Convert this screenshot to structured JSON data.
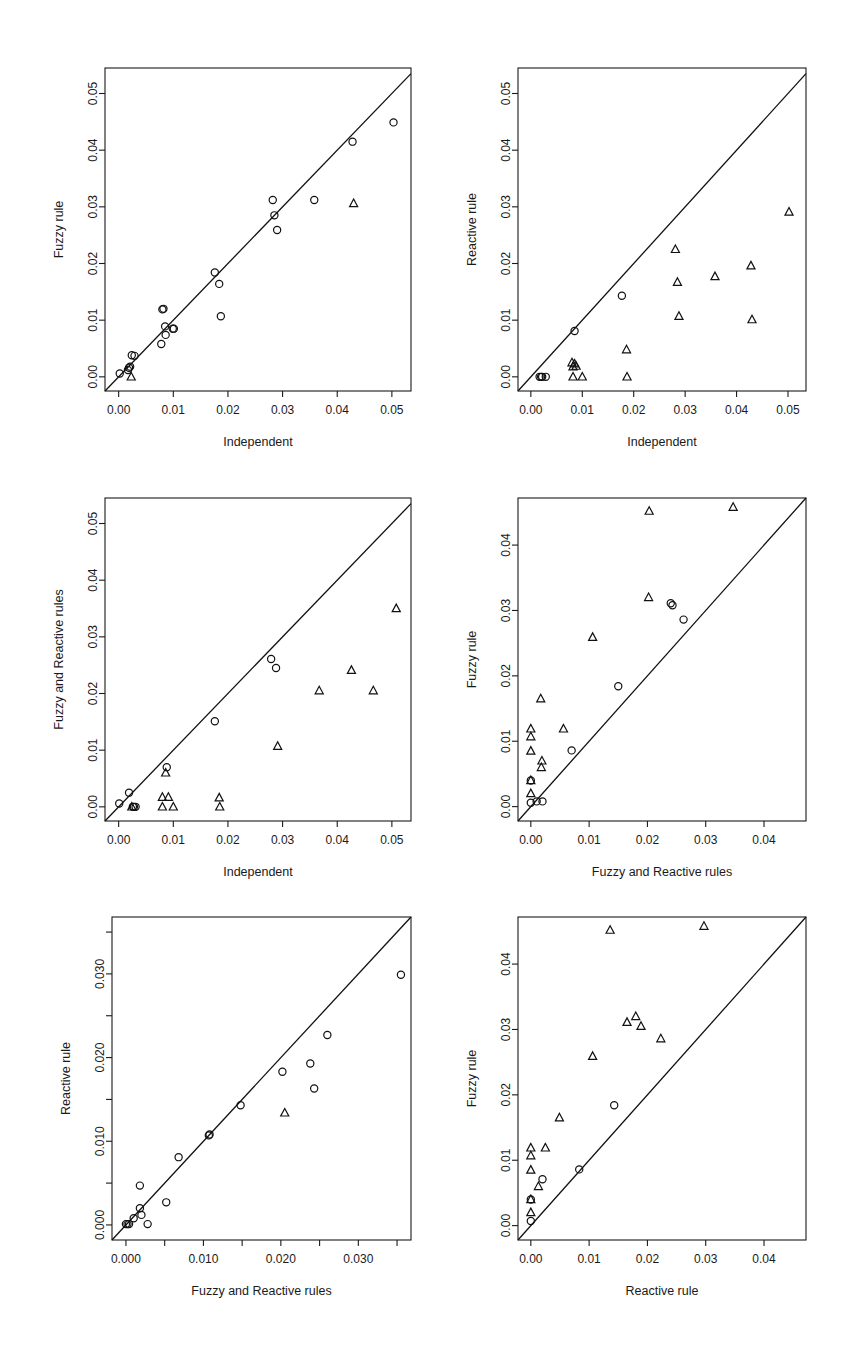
{
  "figure": {
    "background": "#ffffff",
    "marker_color": "#111111",
    "panel_count": 6,
    "layout": "3 rows x 2 columns of scatter plots",
    "reference_line": "y = x identity diagonal"
  },
  "chart_data": [
    {
      "id": "panel-1",
      "type": "scatter",
      "title": "",
      "xlabel": "Independent",
      "ylabel": "Fuzzy rule",
      "xlim": [
        -0.0025,
        0.0535
      ],
      "ylim": [
        -0.0025,
        0.0545
      ],
      "xticks": [
        0.0,
        0.01,
        0.02,
        0.03,
        0.04,
        0.05
      ],
      "xtick_labels": [
        "0.00",
        "0.01",
        "0.02",
        "0.03",
        "0.04",
        "0.05"
      ],
      "yticks": [
        0.0,
        0.01,
        0.02,
        0.03,
        0.04,
        0.05
      ],
      "ytick_labels": [
        "0.00",
        "0.01",
        "0.02",
        "0.03",
        "0.04",
        "0.05"
      ],
      "grid": false,
      "legend": "none",
      "annotations": [
        "identity line y = x"
      ],
      "series": [
        {
          "name": "circle",
          "marker": "circle",
          "points": [
            [
              0.0002,
              0.0006
            ],
            [
              0.0017,
              0.0012
            ],
            [
              0.0019,
              0.0016
            ],
            [
              0.0021,
              0.0018
            ],
            [
              0.0024,
              0.0038
            ],
            [
              0.0029,
              0.0037
            ],
            [
              0.0078,
              0.0058
            ],
            [
              0.008,
              0.0119
            ],
            [
              0.0082,
              0.012
            ],
            [
              0.0085,
              0.0089
            ],
            [
              0.0086,
              0.0074
            ],
            [
              0.0099,
              0.0085
            ],
            [
              0.0101,
              0.0085
            ],
            [
              0.0176,
              0.0184
            ],
            [
              0.0184,
              0.0164
            ],
            [
              0.0187,
              0.0107
            ],
            [
              0.0282,
              0.0312
            ],
            [
              0.0285,
              0.0285
            ],
            [
              0.029,
              0.0259
            ],
            [
              0.0358,
              0.0312
            ],
            [
              0.0428,
              0.0415
            ],
            [
              0.0503,
              0.0449
            ]
          ]
        },
        {
          "name": "triangle",
          "marker": "triangle",
          "points": [
            [
              0.0023,
              0.0
            ],
            [
              0.043,
              0.0306
            ]
          ]
        }
      ]
    },
    {
      "id": "panel-2",
      "type": "scatter",
      "title": "",
      "xlabel": "Independent",
      "ylabel": "Reactive rule",
      "xlim": [
        -0.0025,
        0.0535
      ],
      "ylim": [
        -0.0025,
        0.0545
      ],
      "xticks": [
        0.0,
        0.01,
        0.02,
        0.03,
        0.04,
        0.05
      ],
      "xtick_labels": [
        "0.00",
        "0.01",
        "0.02",
        "0.03",
        "0.04",
        "0.05"
      ],
      "yticks": [
        0.0,
        0.01,
        0.02,
        0.03,
        0.04,
        0.05
      ],
      "ytick_labels": [
        "0.00",
        "0.01",
        "0.02",
        "0.03",
        "0.04",
        "0.05"
      ],
      "grid": false,
      "legend": "none",
      "annotations": [
        "identity line y = x"
      ],
      "series": [
        {
          "name": "circle",
          "marker": "circle",
          "points": [
            [
              0.0017,
              0.0
            ],
            [
              0.002,
              0.0
            ],
            [
              0.0022,
              0.0
            ],
            [
              0.0029,
              0.0
            ],
            [
              0.0085,
              0.0081
            ],
            [
              0.0177,
              0.0143
            ]
          ]
        },
        {
          "name": "triangle",
          "marker": "triangle",
          "points": [
            [
              0.008,
              0.0025
            ],
            [
              0.0082,
              0.0018
            ],
            [
              0.0085,
              0.0023
            ],
            [
              0.0082,
              0.0
            ],
            [
              0.0088,
              0.0019
            ],
            [
              0.01,
              0.0
            ],
            [
              0.0186,
              0.0048
            ],
            [
              0.0187,
              0.0
            ],
            [
              0.0281,
              0.0225
            ],
            [
              0.0285,
              0.0167
            ],
            [
              0.0288,
              0.0107
            ],
            [
              0.0358,
              0.0177
            ],
            [
              0.0428,
              0.0196
            ],
            [
              0.043,
              0.0101
            ],
            [
              0.0502,
              0.0291
            ]
          ]
        }
      ]
    },
    {
      "id": "panel-3",
      "type": "scatter",
      "title": "",
      "xlabel": "Independent",
      "ylabel": "Fuzzy and Reactive rules",
      "xlim": [
        -0.0025,
        0.0535
      ],
      "ylim": [
        -0.0025,
        0.0545
      ],
      "xticks": [
        0.0,
        0.01,
        0.02,
        0.03,
        0.04,
        0.05
      ],
      "xtick_labels": [
        "0.00",
        "0.01",
        "0.02",
        "0.03",
        "0.04",
        "0.05"
      ],
      "yticks": [
        0.0,
        0.01,
        0.02,
        0.03,
        0.04,
        0.05
      ],
      "ytick_labels": [
        "0.00",
        "0.01",
        "0.02",
        "0.03",
        "0.04",
        "0.05"
      ],
      "grid": false,
      "legend": "none",
      "annotations": [
        "identity line y = x"
      ],
      "series": [
        {
          "name": "circle",
          "marker": "circle",
          "points": [
            [
              0.0001,
              0.0006
            ],
            [
              0.0019,
              0.0025
            ],
            [
              0.0026,
              0.0
            ],
            [
              0.0028,
              0.0
            ],
            [
              0.0031,
              0.0
            ],
            [
              0.0088,
              0.007
            ],
            [
              0.0176,
              0.0151
            ],
            [
              0.0279,
              0.0261
            ],
            [
              0.0288,
              0.0245
            ]
          ]
        },
        {
          "name": "triangle",
          "marker": "triangle",
          "points": [
            [
              0.0024,
              0.0
            ],
            [
              0.008,
              0.0017
            ],
            [
              0.008,
              0.0
            ],
            [
              0.0086,
              0.006
            ],
            [
              0.0091,
              0.0017
            ],
            [
              0.01,
              0.0
            ],
            [
              0.0184,
              0.0016
            ],
            [
              0.0185,
              0.0
            ],
            [
              0.0291,
              0.0107
            ],
            [
              0.0367,
              0.0205
            ],
            [
              0.0426,
              0.0241
            ],
            [
              0.0466,
              0.0205
            ],
            [
              0.0508,
              0.035
            ]
          ]
        }
      ]
    },
    {
      "id": "panel-4",
      "type": "scatter",
      "title": "",
      "xlabel": "Fuzzy and Reactive rules",
      "ylabel": "Fuzzy rule",
      "xlim": [
        -0.0022,
        0.0472
      ],
      "ylim": [
        -0.0022,
        0.0472
      ],
      "xticks": [
        0.0,
        0.01,
        0.02,
        0.03,
        0.04
      ],
      "xtick_labels": [
        "0.00",
        "0.01",
        "0.02",
        "0.03",
        "0.04"
      ],
      "yticks": [
        0.0,
        0.01,
        0.02,
        0.03,
        0.04
      ],
      "ytick_labels": [
        "0.00",
        "0.01",
        "0.02",
        "0.03",
        "0.04"
      ],
      "grid": false,
      "legend": "none",
      "annotations": [
        "identity line y = x"
      ],
      "series": [
        {
          "name": "circle",
          "marker": "circle",
          "points": [
            [
              0.0,
              0.004
            ],
            [
              0.0,
              0.0006
            ],
            [
              0.001,
              0.0008
            ],
            [
              0.002,
              0.0008
            ],
            [
              0.007,
              0.0086
            ],
            [
              0.015,
              0.0184
            ],
            [
              0.024,
              0.0311
            ],
            [
              0.0243,
              0.0308
            ],
            [
              0.0262,
              0.0286
            ]
          ]
        },
        {
          "name": "triangle",
          "marker": "triangle",
          "points": [
            [
              0.0,
              0.0119
            ],
            [
              0.0,
              0.0107
            ],
            [
              0.0,
              0.0085
            ],
            [
              0.0,
              0.004
            ],
            [
              0.0,
              0.002
            ],
            [
              0.0017,
              0.0165
            ],
            [
              0.0019,
              0.007
            ],
            [
              0.0018,
              0.006
            ],
            [
              0.0056,
              0.0119
            ],
            [
              0.0106,
              0.0259
            ],
            [
              0.0202,
              0.032
            ],
            [
              0.0203,
              0.0452
            ],
            [
              0.0347,
              0.0458
            ]
          ]
        }
      ]
    },
    {
      "id": "panel-5",
      "type": "scatter",
      "title": "",
      "xlabel": "Fuzzy and Reactive rules",
      "ylabel": "Reactive rule",
      "xlim": [
        -0.0018,
        0.0368
      ],
      "ylim": [
        -0.0018,
        0.0368
      ],
      "xticks": [
        0.0,
        0.005,
        0.01,
        0.015,
        0.02,
        0.025,
        0.03,
        0.035
      ],
      "xtick_labels": [
        "0.000",
        "",
        "0.010",
        "",
        "0.020",
        "",
        "0.030",
        ""
      ],
      "yticks": [
        0.0,
        0.005,
        0.01,
        0.015,
        0.02,
        0.025,
        0.03,
        0.035
      ],
      "ytick_labels": [
        "0.000",
        "",
        "0.010",
        "",
        "0.020",
        "",
        "0.030",
        ""
      ],
      "grid": false,
      "legend": "none",
      "annotations": [
        "identity line y = x",
        "minor unlabeled ticks at 0.005 intervals"
      ],
      "series": [
        {
          "name": "circle",
          "marker": "circle",
          "points": [
            [
              0.0,
              0.0001
            ],
            [
              0.0002,
              0.0001
            ],
            [
              0.0004,
              0.0001
            ],
            [
              0.001,
              0.0008
            ],
            [
              0.0018,
              0.002
            ],
            [
              0.0018,
              0.0047
            ],
            [
              0.002,
              0.0012
            ],
            [
              0.0028,
              0.0001
            ],
            [
              0.0052,
              0.0027
            ],
            [
              0.0068,
              0.0081
            ],
            [
              0.0107,
              0.0107
            ],
            [
              0.0108,
              0.0108
            ],
            [
              0.0148,
              0.0143
            ],
            [
              0.0202,
              0.0183
            ],
            [
              0.0238,
              0.0193
            ],
            [
              0.0243,
              0.0163
            ],
            [
              0.026,
              0.0227
            ],
            [
              0.0355,
              0.0299
            ]
          ]
        },
        {
          "name": "triangle",
          "marker": "triangle",
          "points": [
            [
              0.0205,
              0.0134
            ]
          ]
        }
      ]
    },
    {
      "id": "panel-6",
      "type": "scatter",
      "title": "",
      "xlabel": "Reactive rule",
      "ylabel": "Fuzzy rule",
      "xlim": [
        -0.0022,
        0.0472
      ],
      "ylim": [
        -0.0022,
        0.0472
      ],
      "xticks": [
        0.0,
        0.01,
        0.02,
        0.03,
        0.04
      ],
      "xtick_labels": [
        "0.00",
        "0.01",
        "0.02",
        "0.03",
        "0.04"
      ],
      "yticks": [
        0.0,
        0.01,
        0.02,
        0.03,
        0.04
      ],
      "ytick_labels": [
        "0.00",
        "0.01",
        "0.02",
        "0.03",
        "0.04"
      ],
      "grid": false,
      "legend": "none",
      "annotations": [
        "identity line y = x"
      ],
      "series": [
        {
          "name": "circle",
          "marker": "circle",
          "points": [
            [
              0.0,
              0.004
            ],
            [
              0.0,
              0.0007
            ],
            [
              0.002,
              0.0071
            ],
            [
              0.0083,
              0.0086
            ],
            [
              0.0143,
              0.0184
            ]
          ]
        },
        {
          "name": "triangle",
          "marker": "triangle",
          "points": [
            [
              0.0,
              0.0119
            ],
            [
              0.0,
              0.0107
            ],
            [
              0.0,
              0.0085
            ],
            [
              0.0,
              0.004
            ],
            [
              0.0,
              0.002
            ],
            [
              0.0013,
              0.006
            ],
            [
              0.0025,
              0.0119
            ],
            [
              0.0049,
              0.0165
            ],
            [
              0.0106,
              0.0259
            ],
            [
              0.0136,
              0.0452
            ],
            [
              0.0165,
              0.0311
            ],
            [
              0.018,
              0.032
            ],
            [
              0.0189,
              0.0305
            ],
            [
              0.0223,
              0.0286
            ],
            [
              0.0297,
              0.0458
            ]
          ]
        }
      ]
    }
  ]
}
